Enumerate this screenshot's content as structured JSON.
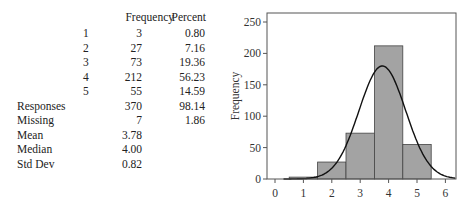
{
  "table": {
    "headers": {
      "frequency": "Frequency",
      "percent": "Percent"
    },
    "rows": [
      {
        "index": "1",
        "frequency": "3",
        "percent": "0.80"
      },
      {
        "index": "2",
        "frequency": "27",
        "percent": "7.16"
      },
      {
        "index": "3",
        "frequency": "73",
        "percent": "19.36"
      },
      {
        "index": "4",
        "frequency": "212",
        "percent": "56.23"
      },
      {
        "index": "5",
        "frequency": "55",
        "percent": "14.59"
      }
    ],
    "summary": [
      {
        "label": "Responses",
        "frequency": "370",
        "percent": "98.14"
      },
      {
        "label": "Missing",
        "frequency": "7",
        "percent": "1.86"
      },
      {
        "label": "Mean",
        "frequency": "3.78",
        "percent": ""
      },
      {
        "label": "Median",
        "frequency": "4.00",
        "percent": ""
      },
      {
        "label": "Std Dev",
        "frequency": "0.82",
        "percent": ""
      }
    ]
  },
  "chart_data": {
    "type": "bar",
    "title": "",
    "xlabel": "",
    "ylabel": "Frequency",
    "categories": [
      "1",
      "2",
      "3",
      "4",
      "5"
    ],
    "values": [
      3,
      27,
      73,
      212,
      55
    ],
    "xlim": [
      -0.35,
      6.35
    ],
    "ylim": [
      0,
      260
    ],
    "xticks": [
      "0",
      "1",
      "2",
      "3",
      "4",
      "5",
      "6"
    ],
    "yticks": [
      "0",
      "50",
      "100",
      "150",
      "200",
      "250"
    ],
    "grid": false,
    "overlay": {
      "type": "normal_curve",
      "mean": 3.78,
      "std": 0.82,
      "n": 370
    },
    "colors": {
      "bar_fill": "#a3a3a3",
      "bar_edge": "#444444",
      "curve": "#111111",
      "frame": "#555555"
    }
  }
}
